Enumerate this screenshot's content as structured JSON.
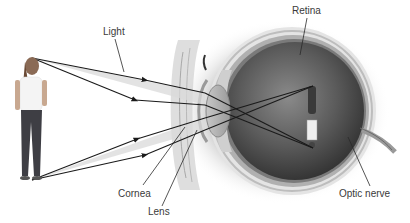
{
  "diagram": {
    "labels": {
      "light": "Light",
      "retina": "Retina",
      "cornea": "Cornea",
      "lens": "Lens",
      "optic_nerve": "Optic nerve"
    },
    "object": "woman-figure",
    "colors": {
      "ray": "#1a1a1a",
      "light_cone": "#dcdcdc",
      "eye_interior": "#4a4a4a",
      "sclera": "#e8e8e8",
      "label_text": "#3a3a3a"
    }
  }
}
